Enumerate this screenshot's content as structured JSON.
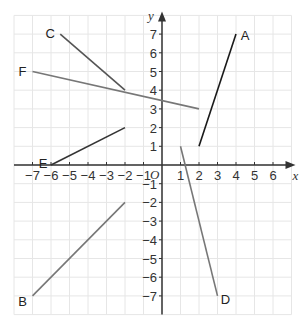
{
  "diagram": {
    "title": "",
    "colors": {
      "grid": "#e6e6e6",
      "axis": "#333333",
      "segment_dark": "#1a1a1a",
      "segment_gray": "#777777",
      "background": "#ffffff"
    },
    "axes": {
      "x_label": "x",
      "y_label": "y",
      "origin_label": "O",
      "x_range": [
        -8,
        7
      ],
      "y_range": [
        -8,
        8
      ],
      "x_ticks": [
        -7,
        -6,
        -5,
        -4,
        -3,
        -2,
        -1,
        1,
        2,
        3,
        4,
        5,
        6
      ],
      "y_ticks": [
        -7,
        -6,
        -5,
        -4,
        -3,
        -2,
        -1,
        1,
        2,
        3,
        4,
        5,
        6,
        7
      ]
    },
    "segments": [
      {
        "label": "A",
        "from": [
          2,
          1
        ],
        "to": [
          4,
          7
        ],
        "label_at": [
          4,
          7
        ],
        "color": "#1a1a1a"
      },
      {
        "label": "B",
        "from": [
          -7,
          -7
        ],
        "to": [
          -2,
          -2
        ],
        "label_at": [
          -7,
          -7
        ],
        "color": "#777777"
      },
      {
        "label": "C",
        "from": [
          -5.5,
          7
        ],
        "to": [
          -2,
          4
        ],
        "label_at": [
          -5.5,
          7
        ],
        "color": "#555555"
      },
      {
        "label": "D",
        "from": [
          1,
          1
        ],
        "to": [
          3,
          -7
        ],
        "label_at": [
          3,
          -7
        ],
        "color": "#777777"
      },
      {
        "label": "E",
        "from": [
          -6,
          0
        ],
        "to": [
          -2,
          2
        ],
        "label_at": [
          -6,
          0
        ],
        "color": "#333333"
      },
      {
        "label": "F",
        "from": [
          -7,
          5
        ],
        "to": [
          2,
          3
        ],
        "label_at": [
          -7,
          5
        ],
        "color": "#777777"
      }
    ]
  }
}
